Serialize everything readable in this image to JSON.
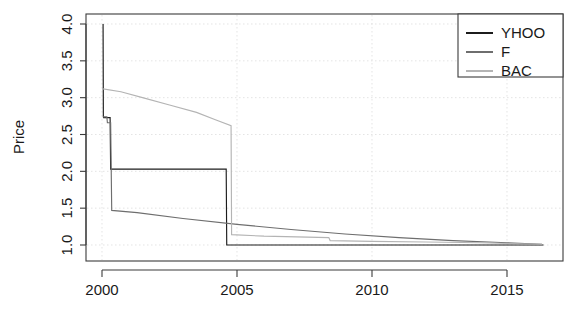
{
  "chart_data": {
    "type": "line",
    "title": "",
    "subtitle": "",
    "xlabel": "",
    "ylabel": "Price",
    "xlim": [
      1999.6,
      2016.6
    ],
    "ylim": [
      0.95,
      4.05
    ],
    "grid": true,
    "legend_position": "top-right",
    "x_ticks": [
      2000,
      2005,
      2010,
      2015
    ],
    "x_tick_labels": [
      "2000",
      "2005",
      "2010",
      "2015"
    ],
    "y_ticks": [
      1.0,
      1.5,
      2.0,
      2.5,
      3.0,
      3.5,
      4.0
    ],
    "y_tick_labels": [
      "1.0",
      "1.5",
      "2.0",
      "2.5",
      "3.0",
      "3.5",
      "4.0"
    ],
    "series": [
      {
        "name": "YHOO",
        "color": "#1c1c1c",
        "points": [
          [
            2000.04,
            4.0
          ],
          [
            2000.05,
            2.74
          ],
          [
            2000.06,
            2.73
          ],
          [
            2000.3,
            2.73
          ],
          [
            2000.32,
            2.03
          ],
          [
            2004.6,
            2.03
          ],
          [
            2004.62,
            1.0
          ],
          [
            2016.35,
            1.0
          ]
        ]
      },
      {
        "name": "F",
        "color": "#6e6e6e",
        "points": [
          [
            2000.04,
            2.74
          ],
          [
            2000.18,
            2.74
          ],
          [
            2000.2,
            2.66
          ],
          [
            2000.32,
            2.66
          ],
          [
            2000.34,
            2.06
          ],
          [
            2000.36,
            1.47
          ],
          [
            2001.3,
            1.44
          ],
          [
            2003.0,
            1.36
          ],
          [
            2005.0,
            1.28
          ],
          [
            2007.0,
            1.21
          ],
          [
            2009.0,
            1.15
          ],
          [
            2011.0,
            1.1
          ],
          [
            2013.0,
            1.06
          ],
          [
            2015.0,
            1.03
          ],
          [
            2016.3,
            1.01
          ]
        ]
      },
      {
        "name": "BAC",
        "color": "#b4b4b4",
        "points": [
          [
            2000.04,
            3.12
          ],
          [
            2000.7,
            3.08
          ],
          [
            2001.5,
            3.0
          ],
          [
            2002.5,
            2.9
          ],
          [
            2003.5,
            2.8
          ],
          [
            2004.2,
            2.7
          ],
          [
            2004.78,
            2.62
          ],
          [
            2004.8,
            1.14
          ],
          [
            2006.0,
            1.12
          ],
          [
            2008.4,
            1.1
          ],
          [
            2008.45,
            1.06
          ],
          [
            2010.0,
            1.05
          ],
          [
            2012.0,
            1.04
          ],
          [
            2014.0,
            1.03
          ],
          [
            2016.3,
            1.01
          ]
        ]
      }
    ]
  },
  "axis": {
    "y_title": "Price"
  },
  "legend": {
    "entries": [
      {
        "label": "YHOO",
        "color": "#1c1c1c"
      },
      {
        "label": "F",
        "color": "#6e6e6e"
      },
      {
        "label": "BAC",
        "color": "#b4b4b4"
      }
    ]
  }
}
